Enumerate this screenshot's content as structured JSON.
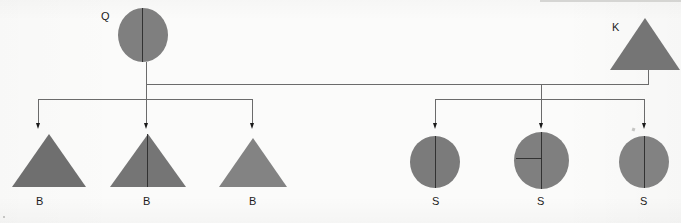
{
  "diagram": {
    "type": "pedigree-tree",
    "title": "",
    "parents": [
      {
        "id": "parent-q",
        "label": "Q",
        "shape": "circle",
        "fill": "#7d7d7d",
        "marks": [
          "vertical-divider"
        ],
        "x": 118,
        "y": 8,
        "size": 50,
        "label_x": 101,
        "label_y": 11
      },
      {
        "id": "parent-k",
        "label": "K",
        "shape": "triangle",
        "fill": "#757575",
        "marks": [],
        "x": 610,
        "y": 18,
        "size": 70,
        "label_x": 612,
        "label_y": 22
      }
    ],
    "children": [
      {
        "id": "child-1",
        "label": "B",
        "shape": "triangle",
        "fill": "#6f6f6f",
        "marks": [],
        "x": 12,
        "y": 132,
        "size": 62,
        "label_x": 36,
        "label_y": 200,
        "arrow_x": 38
      },
      {
        "id": "child-2",
        "label": "B",
        "shape": "triangle",
        "fill": "#757575",
        "marks": [
          "vertical-divider"
        ],
        "x": 114,
        "y": 132,
        "size": 68,
        "label_x": 145,
        "label_y": 200,
        "arrow_x": 147
      },
      {
        "id": "child-3",
        "label": "B",
        "shape": "triangle",
        "fill": "#838383",
        "marks": [],
        "x": 222,
        "y": 136,
        "size": 60,
        "label_x": 250,
        "label_y": 200,
        "arrow_x": 252
      },
      {
        "id": "child-4",
        "label": "S",
        "shape": "circle",
        "fill": "#7b7b7b",
        "marks": [
          "vertical-divider"
        ],
        "x": 410,
        "y": 134,
        "size": 50,
        "label_x": 432,
        "label_y": 200,
        "arrow_x": 435
      },
      {
        "id": "child-5",
        "label": "S",
        "shape": "circle",
        "fill": "#7f7f7f",
        "marks": [
          "vertical-divider",
          "horizontal-left-radius"
        ],
        "x": 514,
        "y": 130,
        "size": 56,
        "label_x": 538,
        "label_y": 200,
        "arrow_x": 542
      },
      {
        "id": "child-6",
        "label": "S",
        "shape": "circle",
        "fill": "#828282",
        "marks": [
          "vertical-divider"
        ],
        "x": 618,
        "y": 134,
        "size": 50,
        "label_x": 641,
        "label_y": 200,
        "arrow_x": 644
      }
    ],
    "connectors": {
      "sibship_line_y": 84,
      "left_group_bar_y": 99,
      "right_group_bar_y": 99,
      "left_bar_from_x": 38,
      "left_bar_to_x": 252,
      "right_bar_from_x": 435,
      "right_bar_to_x": 644,
      "parent_q_stem_x": 146,
      "parent_k_stem_x": 648,
      "line_color": "#6b6b6b",
      "arrow_color": "#1a1a1a"
    },
    "legend_note": ""
  }
}
